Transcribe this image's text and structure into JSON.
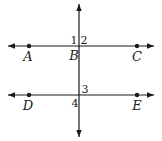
{
  "figure": {
    "background_color": "#ffffff",
    "stroke_color": "#1a1a1a",
    "lines": [
      {
        "name": "top-parallel-line",
        "x1": 8,
        "y1": 46,
        "x2": 154,
        "y2": 46,
        "arrows": "both"
      },
      {
        "name": "bottom-parallel-line",
        "x1": 8,
        "y1": 95,
        "x2": 154,
        "y2": 95,
        "arrows": "both"
      },
      {
        "name": "transversal-line",
        "x1": 79,
        "y1": 4,
        "x2": 79,
        "y2": 137,
        "arrows": "both"
      }
    ],
    "points": [
      {
        "name": "point-A",
        "x": 29,
        "y": 46
      },
      {
        "name": "point-C",
        "x": 137,
        "y": 46
      },
      {
        "name": "point-D",
        "x": 29,
        "y": 95
      },
      {
        "name": "point-E",
        "x": 137,
        "y": 95
      }
    ],
    "labels": [
      {
        "name": "label-A",
        "text": "A",
        "x": 28,
        "y": 61,
        "kind": "point"
      },
      {
        "name": "label-B",
        "text": "B",
        "x": 74,
        "y": 60,
        "kind": "point"
      },
      {
        "name": "label-C",
        "text": "C",
        "x": 137,
        "y": 61,
        "kind": "point"
      },
      {
        "name": "label-D",
        "text": "D",
        "x": 28,
        "y": 110,
        "kind": "point"
      },
      {
        "name": "label-E",
        "text": "E",
        "x": 137,
        "y": 110,
        "kind": "point"
      },
      {
        "name": "label-angle-1",
        "text": "1",
        "x": 74,
        "y": 44,
        "kind": "angle"
      },
      {
        "name": "label-angle-2",
        "text": "2",
        "x": 84,
        "y": 44,
        "kind": "angle"
      },
      {
        "name": "label-angle-3",
        "text": "3",
        "x": 85,
        "y": 93,
        "kind": "angle"
      },
      {
        "name": "label-angle-4",
        "text": "4",
        "x": 75,
        "y": 107,
        "kind": "angle"
      }
    ]
  }
}
